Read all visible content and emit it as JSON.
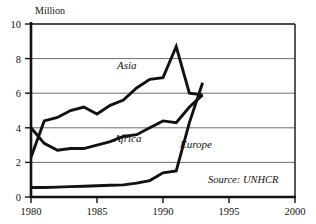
{
  "chart_data": {
    "type": "line",
    "title": "",
    "subtitle": "",
    "ylabel": "Million",
    "xlabel": "",
    "ylim": [
      0,
      10
    ],
    "xlim": [
      1980,
      2000
    ],
    "yticks": [
      "0",
      "2",
      "4",
      "6",
      "8",
      "10"
    ],
    "ytick_values": [
      0,
      2,
      4,
      6,
      8,
      10
    ],
    "xticks": [
      "1980",
      "1985",
      "1990",
      "1995",
      "2000"
    ],
    "xtick_values": [
      1980,
      1985,
      1990,
      1995,
      2000
    ],
    "grid": true,
    "legend_position": "inline-annotations",
    "annotations": [
      {
        "text": "Asia",
        "x": 1987.0,
        "y": 7.2
      },
      {
        "text": "Africa",
        "x": 1986.5,
        "y": 3.5
      },
      {
        "text": "Europe",
        "x": 1992.6,
        "y": 2.9
      },
      {
        "text": "Source: UNHCR",
        "x": 1996.0,
        "y": 1.1
      }
    ],
    "series": [
      {
        "name": "Asia",
        "x": [
          1980,
          1981,
          1982,
          1983,
          1984,
          1985,
          1986,
          1987,
          1988,
          1989,
          1990,
          1991,
          1992,
          1993
        ],
        "values": [
          2.3,
          4.4,
          4.6,
          5.0,
          5.2,
          4.8,
          5.3,
          5.6,
          6.3,
          6.8,
          6.9,
          8.7,
          6.0,
          5.9
        ]
      },
      {
        "name": "Africa",
        "x": [
          1980,
          1981,
          1982,
          1983,
          1984,
          1985,
          1986,
          1987,
          1988,
          1989,
          1990,
          1991,
          1992,
          1993
        ],
        "values": [
          4.0,
          3.1,
          2.7,
          2.8,
          2.8,
          3.0,
          3.2,
          3.5,
          3.6,
          4.0,
          4.4,
          4.3,
          5.2,
          5.9
        ]
      },
      {
        "name": "Europe",
        "x": [
          1980,
          1981,
          1982,
          1983,
          1984,
          1985,
          1986,
          1987,
          1988,
          1989,
          1990,
          1991,
          1992,
          1993
        ],
        "values": [
          0.55,
          0.55,
          0.57,
          0.6,
          0.62,
          0.65,
          0.68,
          0.7,
          0.8,
          0.95,
          1.4,
          1.5,
          4.3,
          6.6
        ]
      }
    ],
    "colors": {
      "line": "#111111",
      "grid": "#6d6d6d",
      "frame": "#111111",
      "background": "#ffffff"
    }
  }
}
